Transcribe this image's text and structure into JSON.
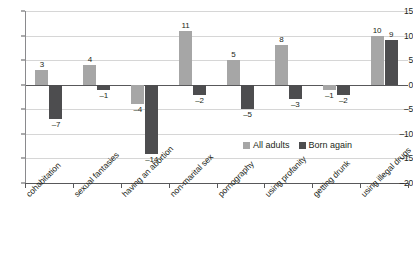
{
  "chart_data": {
    "type": "bar",
    "title": "",
    "subtitle": "",
    "xlabel": "",
    "ylabel": "",
    "ylim": [
      -20,
      15
    ],
    "ytick_values": [
      15,
      10,
      5,
      0,
      -5,
      -10,
      -15,
      -20
    ],
    "ytick_labels": [
      "15",
      "10",
      "5",
      "0",
      "–5",
      "–10",
      "–15",
      "–20"
    ],
    "grid": true,
    "legend_position": "inside-bottom-right",
    "categories": [
      "cohabitation",
      "sexual fantasies",
      "having an abortion",
      "non-marital sex",
      "pornography",
      "using profanity",
      "getting drunk",
      "using illegal drugs"
    ],
    "series": [
      {
        "name": "All adults",
        "color": "#a6a6a6",
        "values": [
          3,
          4,
          -4,
          11,
          5,
          8,
          -1,
          10
        ],
        "labels": [
          "3",
          "4",
          "–4",
          "11",
          "5",
          "8",
          "–1",
          "10"
        ]
      },
      {
        "name": "Born again",
        "color": "#4d4d4f",
        "values": [
          -7,
          -1,
          -14,
          -2,
          -5,
          -3,
          -2,
          9
        ],
        "labels": [
          "–7",
          "–1",
          "–14",
          "–2",
          "–5",
          "–3",
          "–2",
          "9"
        ]
      }
    ]
  },
  "legend": {
    "items": [
      {
        "label": "All adults"
      },
      {
        "label": "Born again"
      }
    ]
  },
  "colors": {
    "all_adults": "#a6a6a6",
    "born_again": "#4d4d4f",
    "gridline": "#d6d6d6",
    "axis": "#58585a",
    "background": "#ffffff"
  }
}
